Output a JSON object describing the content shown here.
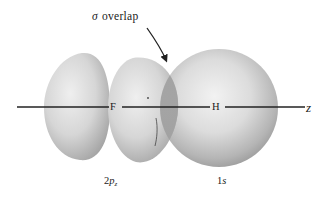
{
  "diagram": {
    "title": {
      "symbol": "σ",
      "text": "overlap"
    },
    "axis": {
      "label": "z",
      "atoms": [
        {
          "name": "F",
          "x": 115
        },
        {
          "name": "H",
          "x": 217
        }
      ]
    },
    "orbitals": [
      {
        "name": "2p_z",
        "label_main": "2",
        "label_italic": "p",
        "label_sub": "z",
        "type": "p-orbital",
        "lobes": 2
      },
      {
        "name": "1s",
        "label_main": "1",
        "label_italic": "s",
        "type": "s-orbital"
      }
    ],
    "annotation": {
      "arrow_target": "overlap region between 2p_z lobe and 1s sphere"
    },
    "colors": {
      "background": "#ffffff",
      "lobe_light": "#e6e6e6",
      "lobe_shadow": "#9a9a9a",
      "overlap_region": "#a8a8a8",
      "axis_line": "#222222",
      "text": "#1a1a1a"
    }
  }
}
